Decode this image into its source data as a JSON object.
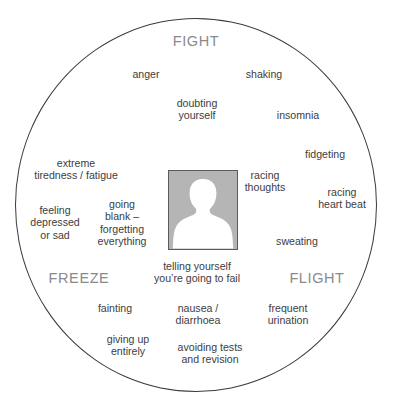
{
  "diagram": {
    "shape": "circle",
    "outline_color": "#3a3a3a",
    "label_color": "#8a8a8a",
    "text_color": "#3d3d3d",
    "avatar": {
      "name": "person-silhouette",
      "background_color": "#b5b5b5",
      "silhouette_color": "#ffffff",
      "border_color": "#5a5a5a"
    },
    "categories": [
      {
        "id": "fight",
        "label": "FIGHT"
      },
      {
        "id": "flight",
        "label": "FLIGHT"
      },
      {
        "id": "freeze",
        "label": "FREEZE"
      }
    ],
    "symptoms": [
      {
        "id": "anger",
        "text": "anger"
      },
      {
        "id": "shaking",
        "text": "shaking"
      },
      {
        "id": "doubting-yourself",
        "line1": "doubting",
        "line2": "yourself"
      },
      {
        "id": "insomnia",
        "text": "insomnia"
      },
      {
        "id": "fidgeting",
        "text": "fidgeting"
      },
      {
        "id": "extreme-tiredness",
        "line1": "extreme",
        "line2": "tiredness / fatigue"
      },
      {
        "id": "racing-thoughts",
        "line1": "racing",
        "line2": "thoughts"
      },
      {
        "id": "racing-heart-beat",
        "line1": "racing",
        "line2": "heart beat"
      },
      {
        "id": "feeling-depressed",
        "line1": "feeling",
        "line2": "depressed",
        "line3": "or sad"
      },
      {
        "id": "going-blank",
        "line1": "going",
        "line2": "blank –",
        "line3": "forgetting",
        "line4": "everything"
      },
      {
        "id": "sweating",
        "text": "sweating"
      },
      {
        "id": "telling-yourself-fail",
        "line1": "telling yourself",
        "line2": "you’re going to fail"
      },
      {
        "id": "fainting",
        "text": "fainting"
      },
      {
        "id": "nausea-diarrhoea",
        "line1": "nausea /",
        "line2": "diarrhoea"
      },
      {
        "id": "frequent-urination",
        "line1": "frequent",
        "line2": "urination"
      },
      {
        "id": "giving-up-entirely",
        "line1": "giving up",
        "line2": "entirely"
      },
      {
        "id": "avoiding-tests",
        "line1": "avoiding tests",
        "line2": "and revision"
      }
    ]
  }
}
